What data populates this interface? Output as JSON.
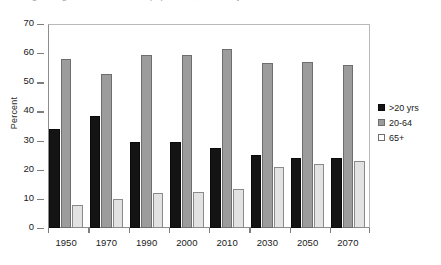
{
  "title_strip": {
    "text": "Figure: Age distribution of the population, selected years"
  },
  "axes": {
    "ylabel": "Percent",
    "yticks": [
      "70",
      "60",
      "50",
      "40",
      "30",
      "20",
      "10",
      "0"
    ]
  },
  "legend": {
    "items": [
      {
        "label": ">20 yrs",
        "color": "#141414",
        "swatch": "legend-swatch-black"
      },
      {
        "label": "20-64",
        "color": "#9c9c9c",
        "swatch": "legend-swatch-gray"
      },
      {
        "label": "65+",
        "color": "#ffffff",
        "swatch": "legend-swatch-white"
      }
    ]
  },
  "chart_data": {
    "type": "bar",
    "title": "",
    "xlabel": "",
    "ylabel": "Percent",
    "ylim": [
      0,
      70
    ],
    "ytick_step": 10,
    "grid": false,
    "legend_position": "right",
    "categories": [
      "1950",
      "1970",
      "1990",
      "2000",
      "2010",
      "2030",
      "2050",
      "2070"
    ],
    "series": [
      {
        "name": ">20 yrs",
        "color": "#141414",
        "values": [
          34,
          38.5,
          29.5,
          29.5,
          27.5,
          25,
          24,
          24
        ]
      },
      {
        "name": "20-64",
        "color": "#9c9c9c",
        "values": [
          58,
          53,
          59.5,
          59.5,
          61.5,
          56.5,
          57,
          56
        ]
      },
      {
        "name": "65+",
        "color": "#e2e2e2",
        "values": [
          8,
          10,
          12,
          12.5,
          13.5,
          21,
          22,
          23
        ]
      }
    ]
  }
}
